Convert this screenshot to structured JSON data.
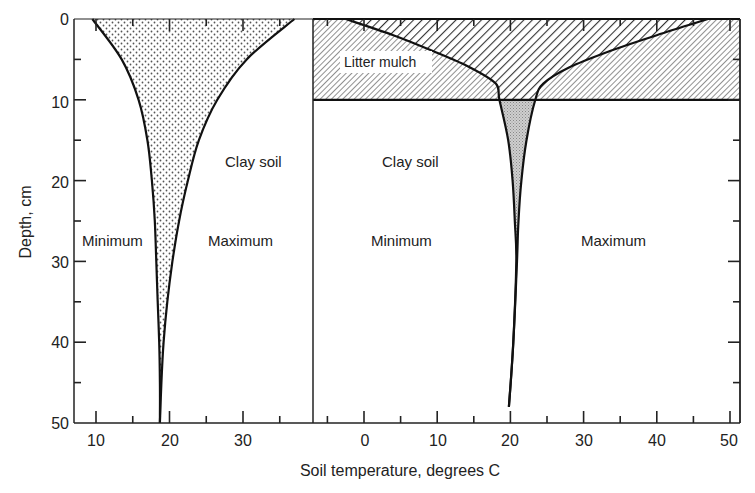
{
  "chart_data": {
    "type": "line",
    "title": "",
    "xlabel": "Soil temperature, degrees C",
    "ylabel": "Depth, cm",
    "y_axis": {
      "ticks": [
        0,
        10,
        20,
        30,
        40,
        50
      ],
      "range": [
        0,
        50
      ],
      "inverted": true
    },
    "grid": false,
    "panels": [
      {
        "name": "Clay soil (bare)",
        "x_ticks": [
          10,
          20,
          30
        ],
        "x_range": [
          7,
          39.5
        ],
        "labels": {
          "soil": "Clay soil",
          "min": "Minimum",
          "max": "Maximum"
        },
        "series": [
          {
            "name": "Minimum",
            "depth": [
              0,
              5,
              10,
              15,
              20,
              25,
              30,
              35,
              40,
              45,
              50
            ],
            "temperature": [
              9.5,
              13.5,
              15.8,
              17.0,
              17.6,
              18.0,
              18.2,
              18.4,
              18.6,
              18.7,
              18.7
            ]
          },
          {
            "name": "Maximum",
            "depth": [
              0,
              5,
              10,
              15,
              20,
              25,
              30,
              35,
              40,
              45,
              50
            ],
            "temperature": [
              37.0,
              30.5,
              26.5,
              24.0,
              22.5,
              21.3,
              20.4,
              19.7,
              19.2,
              18.9,
              18.7
            ]
          }
        ],
        "fill_between": "stippled"
      },
      {
        "name": "Clay soil with litter mulch",
        "x_ticks": [
          0,
          10,
          20,
          30,
          40,
          50
        ],
        "x_range": [
          -7,
          51.5
        ],
        "mulch_layer": {
          "label": "Litter mulch",
          "depth_range": [
            0,
            10
          ]
        },
        "labels": {
          "soil": "Clay soil",
          "min": "Minimum",
          "max": "Maximum"
        },
        "series": [
          {
            "name": "Minimum",
            "depth": [
              0,
              2,
              4,
              6,
              8,
              10,
              15,
              20,
              25,
              30,
              40,
              48
            ],
            "temperature": [
              -2.5,
              4.0,
              9.5,
              14.5,
              18.0,
              18.5,
              19.7,
              20.3,
              20.6,
              20.8,
              20.4,
              19.8
            ]
          },
          {
            "name": "Maximum",
            "depth": [
              0,
              2,
              4,
              6,
              8,
              10,
              15,
              20,
              25,
              30,
              40,
              48
            ],
            "temperature": [
              47.0,
              40.0,
              33.5,
              28.0,
              24.5,
              23.4,
              22.2,
              21.5,
              21.1,
              20.9,
              20.4,
              19.8
            ]
          }
        ],
        "fill_between": "shaded"
      }
    ]
  },
  "text": {
    "ylabel": "Depth, cm",
    "xlabel": "Soil temperature, degrees C",
    "y_ticks": [
      "0",
      "10",
      "20",
      "30",
      "40",
      "50"
    ],
    "left_x_ticks": [
      "10",
      "20",
      "30"
    ],
    "right_x_ticks": [
      "0",
      "10",
      "20",
      "30",
      "40",
      "50"
    ],
    "left": {
      "soil": "Clay soil",
      "min": "Minimum",
      "max": "Maximum"
    },
    "right": {
      "mulch": "Litter mulch",
      "soil": "Clay soil",
      "min": "Minimum",
      "max": "Maximum"
    }
  },
  "colors": {
    "line": "#111111",
    "stipple": "#555555",
    "shade": "#bdbdbd",
    "hatch": "#444444"
  }
}
